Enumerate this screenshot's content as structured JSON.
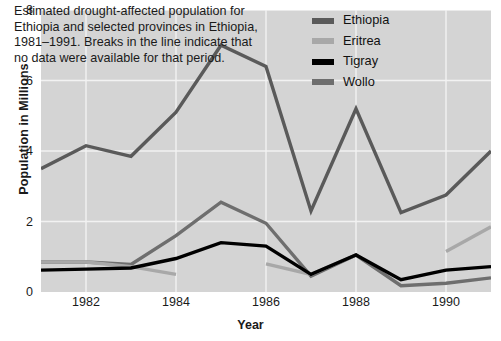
{
  "chart_data": {
    "type": "line",
    "title": "",
    "xlabel": "Year",
    "ylabel": "Population in Millions",
    "xlim": [
      1981,
      1991
    ],
    "ylim": [
      0,
      8
    ],
    "yticks": [
      0,
      2,
      4,
      6,
      8
    ],
    "xticks": [
      1982,
      1984,
      1986,
      1988,
      1990
    ],
    "grid": true,
    "legend_position": "top-right",
    "annotation": "Estimated drought-affected population for Ethiopia and selected provinces in Ethiopia, 1981–1991. Breaks in the line indicate that no data were available for that period.",
    "x": [
      1981,
      1982,
      1983,
      1984,
      1985,
      1986,
      1987,
      1988,
      1989,
      1990,
      1991
    ],
    "series": [
      {
        "name": "Ethiopia",
        "color": "#5a5a5a",
        "values": [
          3.5,
          4.15,
          3.85,
          5.1,
          7.0,
          6.4,
          2.3,
          5.2,
          2.25,
          2.75,
          4.0
        ]
      },
      {
        "name": "Eritrea",
        "color": "#a8a8a8",
        "segments": [
          {
            "x": [
              1981,
              1982,
              1983,
              1984
            ],
            "values": [
              0.85,
              0.85,
              0.72,
              0.5
            ]
          },
          {
            "x": [
              1986,
              1987,
              1988
            ],
            "values": [
              0.8,
              0.5,
              1.05
            ]
          },
          {
            "x": [
              1990,
              1991
            ],
            "values": [
              1.15,
              1.85
            ]
          }
        ]
      },
      {
        "name": "Tigray",
        "color": "#000000",
        "values": [
          0.62,
          0.65,
          0.68,
          0.95,
          1.4,
          1.3,
          0.5,
          1.05,
          0.35,
          0.62,
          0.72
        ]
      },
      {
        "name": "Wollo",
        "color": "#6e6e6e",
        "values": [
          0.85,
          0.85,
          0.78,
          1.6,
          2.55,
          1.95,
          0.45,
          1.05,
          0.18,
          0.25,
          0.4
        ]
      }
    ]
  },
  "axes": {
    "y_title": "Population in Millions",
    "x_title": "Year",
    "y_tick_labels": [
      "0",
      "2",
      "4",
      "6",
      "8"
    ],
    "x_tick_labels": [
      "1982",
      "1984",
      "1986",
      "1988",
      "1990"
    ]
  },
  "annotation": {
    "text": "Estimated drought-affected population for Ethiopia and selected provinces in Ethiopia, 1981–1991. Breaks in the line indicate that no data were available for that period."
  },
  "legend": {
    "items": [
      {
        "label": "Ethiopia",
        "color": "#5a5a5a"
      },
      {
        "label": "Eritrea",
        "color": "#a8a8a8"
      },
      {
        "label": "Tigray",
        "color": "#000000"
      },
      {
        "label": "Wollo",
        "color": "#6e6e6e"
      }
    ]
  },
  "colors": {
    "plot_background": "#d4d4d4",
    "gridline": "#f2f2f2",
    "page_background": "#ffffff",
    "text": "#1a1a1a"
  }
}
